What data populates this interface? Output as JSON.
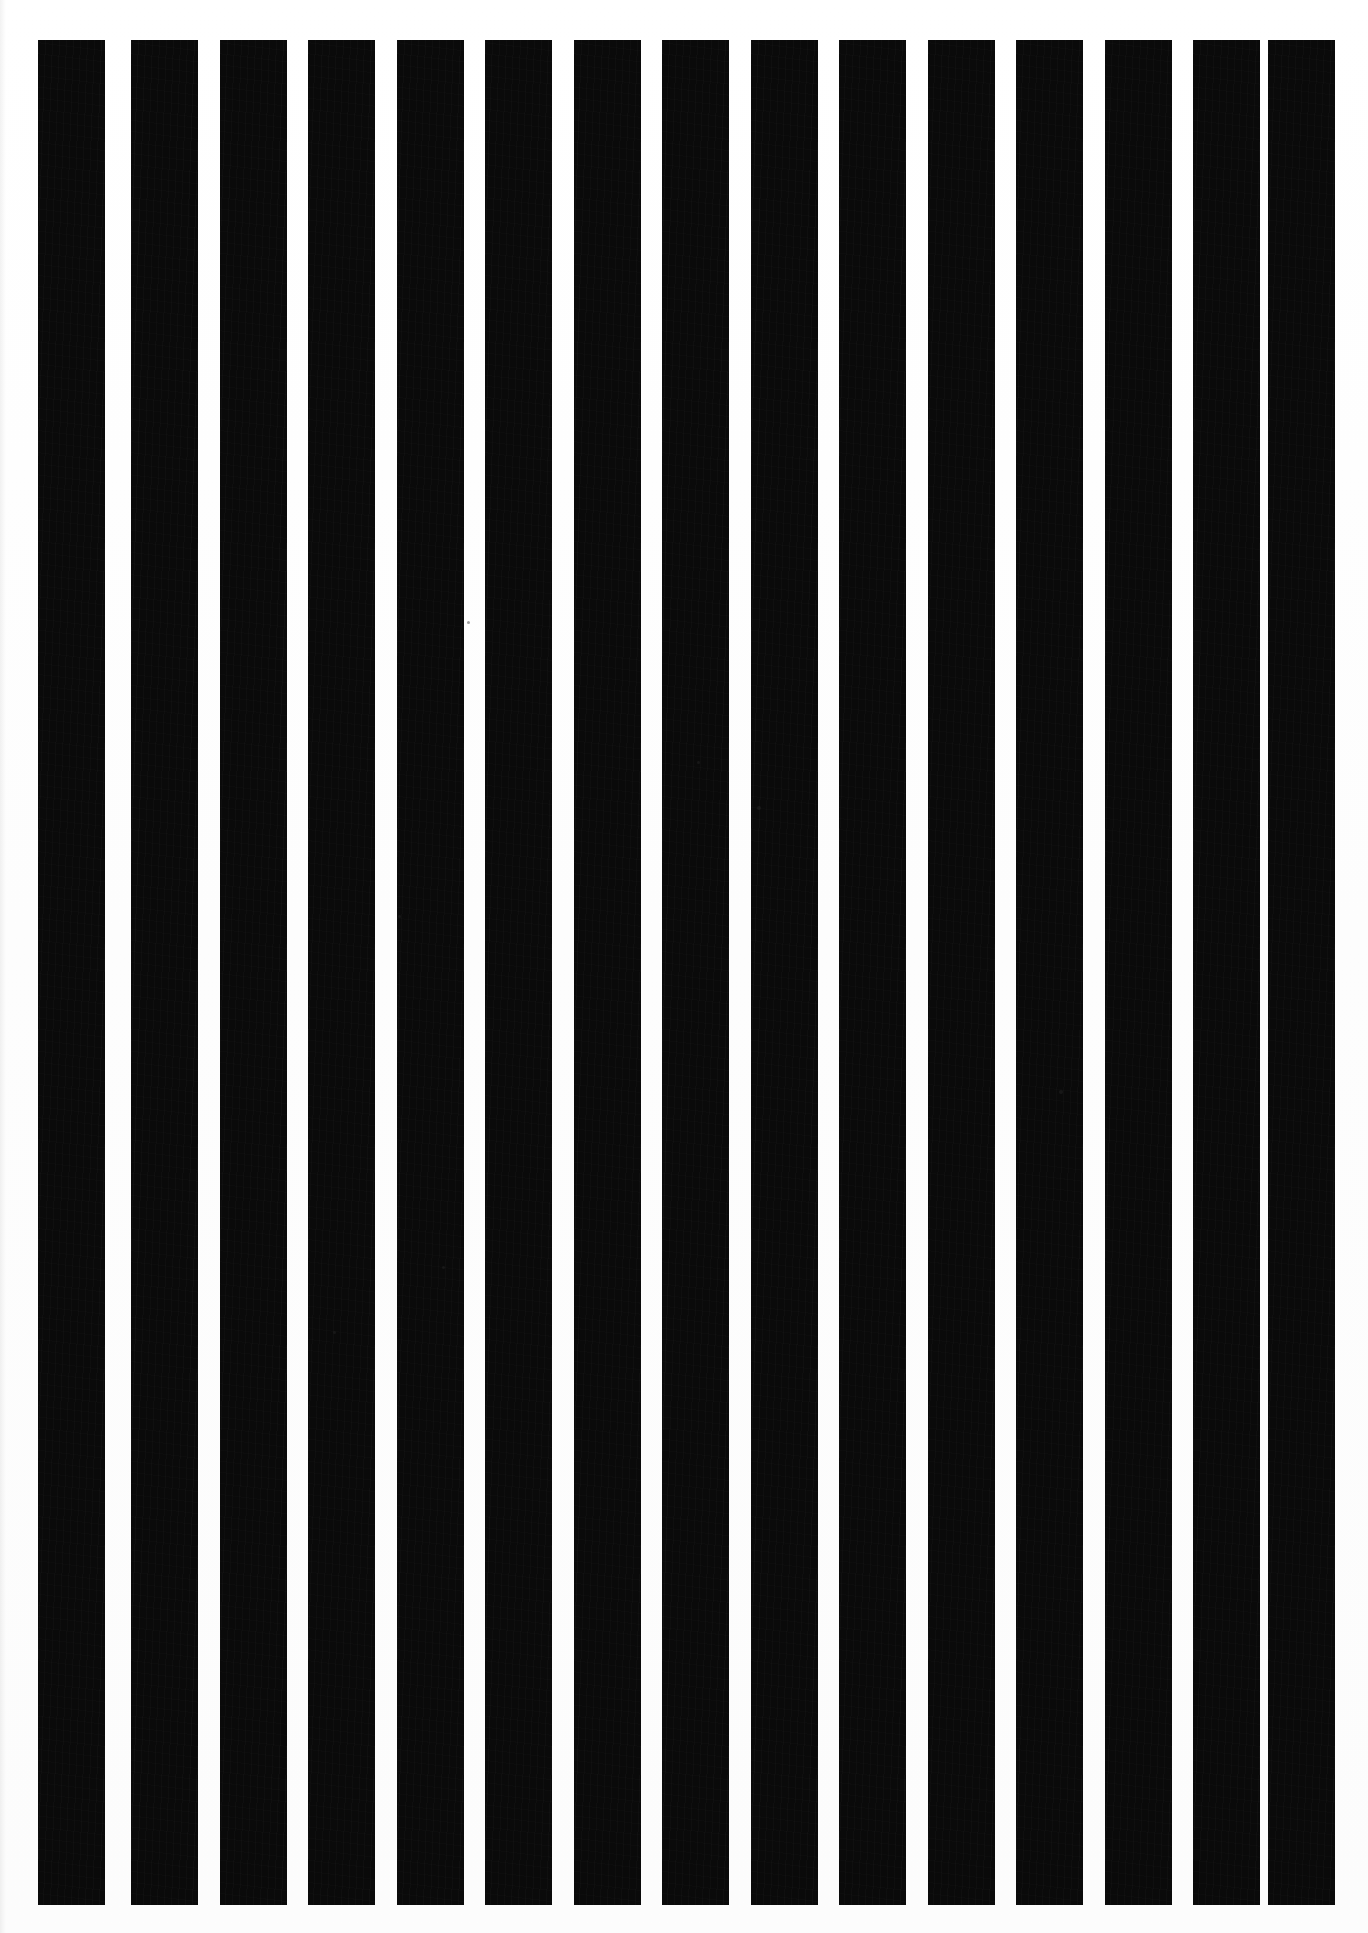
{
  "page": {
    "width": 1368,
    "height": 1933,
    "background_color": "#ffffff",
    "stripe_color": "#0a0a0a"
  },
  "pattern": {
    "orientation": "vertical",
    "bar_count": 15,
    "bar_top": 40,
    "bar_bottom": 1905,
    "bar_height": 1865,
    "bar_width": 67,
    "gap_width": 22,
    "pitch": 89,
    "first_bar_left": 38,
    "last_bar_right": 1335,
    "margin_left": 38,
    "margin_right": 33,
    "margin_top": 40,
    "margin_bottom": 28,
    "duty_cycle_percent": 75
  },
  "bars": [
    {
      "index": 1,
      "left": 38,
      "width": 67
    },
    {
      "index": 2,
      "left": 131,
      "width": 67
    },
    {
      "index": 3,
      "left": 220,
      "width": 67
    },
    {
      "index": 4,
      "left": 308,
      "width": 67
    },
    {
      "index": 5,
      "left": 397,
      "width": 67
    },
    {
      "index": 6,
      "left": 485,
      "width": 67
    },
    {
      "index": 7,
      "left": 574,
      "width": 67
    },
    {
      "index": 8,
      "left": 662,
      "width": 67
    },
    {
      "index": 9,
      "left": 751,
      "width": 67
    },
    {
      "index": 10,
      "left": 839,
      "width": 67
    },
    {
      "index": 11,
      "left": 928,
      "width": 67
    },
    {
      "index": 12,
      "left": 1016,
      "width": 67
    },
    {
      "index": 13,
      "left": 1105,
      "width": 67
    },
    {
      "index": 14,
      "left": 1193,
      "width": 67
    },
    {
      "index": 15,
      "left": 1268,
      "width": 67
    }
  ],
  "specks": [
    {
      "name": "speck-upper-right",
      "left": 757,
      "top": 806,
      "size": 4
    },
    {
      "name": "speck-lower-right",
      "left": 1059,
      "top": 1090,
      "size": 4
    },
    {
      "name": "speck-mid-left",
      "left": 398,
      "top": 915,
      "size": 3
    },
    {
      "name": "speck-mid-center",
      "left": 467,
      "top": 621,
      "size": 3
    },
    {
      "name": "speck-lower-left",
      "left": 333,
      "top": 1331,
      "size": 3
    },
    {
      "name": "speck-lower-center",
      "left": 442,
      "top": 1266,
      "size": 3
    },
    {
      "name": "speck-upper-center",
      "left": 697,
      "top": 761,
      "size": 3
    }
  ],
  "chart_data": {
    "type": "bar",
    "xlabel": "",
    "ylabel": "",
    "categories": [
      "1",
      "2",
      "3",
      "4",
      "5",
      "6",
      "7",
      "8",
      "9",
      "10",
      "11",
      "12",
      "13",
      "14",
      "15"
    ],
    "values": [
      100,
      100,
      100,
      100,
      100,
      100,
      100,
      100,
      100,
      100,
      100,
      100,
      100,
      100,
      100
    ],
    "ylim": [
      0,
      100
    ],
    "grid": false,
    "legend": "none"
  }
}
